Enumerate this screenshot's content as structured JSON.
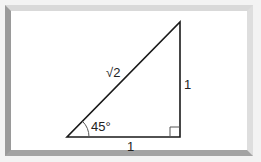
{
  "diagram": {
    "type": "right-triangle",
    "labels": {
      "hypotenuse": "√2",
      "vertical_side": "1",
      "horizontal_side": "1",
      "angle": "45°"
    },
    "right_angle_marker": true,
    "colors": {
      "line": "#1a1a1a",
      "arc": "#555555",
      "frame_light": "#d9d9d9",
      "frame_dark": "#9a9a9a"
    }
  }
}
